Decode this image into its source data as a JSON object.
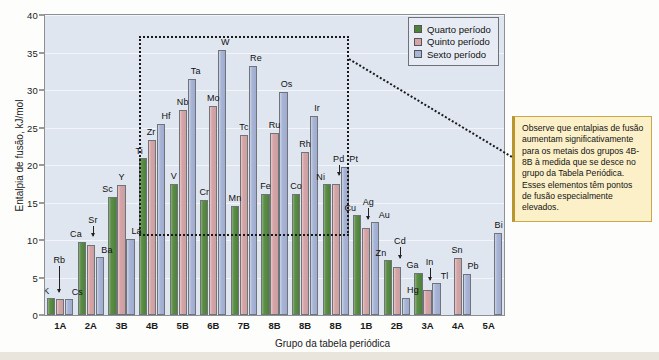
{
  "chart_data": {
    "type": "bar",
    "title": "",
    "xlabel": "Grupo da tabela periódica",
    "ylabel": "Entalpia de fusão, kJ/mol",
    "ylim": [
      0,
      40
    ],
    "yticks": [
      0,
      5,
      10,
      15,
      20,
      25,
      30,
      35,
      40
    ],
    "grid": true,
    "legend_position": "top-right",
    "categories": [
      "1A",
      "2A",
      "3B",
      "4B",
      "5B",
      "6B",
      "7B",
      "8B",
      "8B",
      "8B",
      "1B",
      "2B",
      "3A",
      "4A",
      "5A"
    ],
    "series": [
      {
        "name": "Quarto período",
        "color": "#4d8039",
        "values": [
          2.3,
          9.7,
          15.8,
          21.0,
          17.5,
          15.3,
          14.6,
          16.2,
          16.2,
          17.5,
          13.3,
          7.3,
          5.6,
          null,
          null
        ],
        "labels": [
          "K",
          "Ca",
          "Sc",
          "Ti",
          "V",
          "Cr",
          "Mn",
          "Fe",
          "Co",
          "Ni",
          "Cu",
          "Zn",
          "Ga",
          null,
          null
        ]
      },
      {
        "name": "Quinto período",
        "color": "#d6a3a6",
        "values": [
          2.2,
          9.4,
          17.3,
          23.3,
          27.3,
          27.9,
          24.0,
          24.3,
          21.7,
          17.5,
          11.6,
          6.4,
          3.3,
          7.6,
          null
        ],
        "labels": [
          "Rb",
          "Sr",
          "Y",
          "Zr",
          "Nb",
          "Mo",
          "Tc",
          "Ru",
          "Rh",
          "Pd",
          "Ag",
          "Cd",
          "In",
          "Sn",
          null
        ]
      },
      {
        "name": "Sexto período",
        "color": "#a9b5d6",
        "values": [
          2.1,
          7.8,
          10.2,
          25.5,
          31.5,
          35.3,
          33.2,
          29.7,
          26.6,
          19.7,
          12.4,
          2.3,
          4.3,
          5.5,
          11.0
        ],
        "labels": [
          "Cs",
          "Ba",
          "La",
          "Hf",
          "Ta",
          "W",
          "Re",
          "Os",
          "Ir",
          "Pt",
          "Au",
          "Hg",
          "Tl",
          "Pb",
          "Bi"
        ]
      }
    ]
  },
  "legend": {
    "items": [
      {
        "label": "Quarto período",
        "color": "#4d8039"
      },
      {
        "label": "Quinto período",
        "color": "#d6a3a6"
      },
      {
        "label": "Sexto período",
        "color": "#a9b5d6"
      }
    ]
  },
  "note": {
    "text": "Observe que entalpias de fusão aumentam significativamente para os metais dos grupos 4B-8B à medida que se desce no grupo da Tabela Periódica. Esses elementos têm pontos de fusão especialmente elevados."
  },
  "annotations": {
    "highlight_box_groups": "4B-8B",
    "highlight_box_label": "dotted-highlight-rectangle"
  }
}
